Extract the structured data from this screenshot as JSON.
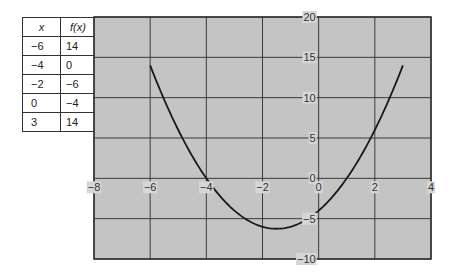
{
  "table": {
    "headers": [
      "x",
      "f(x)"
    ],
    "rows": [
      {
        "x": "−6",
        "fx": "14"
      },
      {
        "x": "−4",
        "fx": "0"
      },
      {
        "x": "−2",
        "fx": "−6"
      },
      {
        "x": "0",
        "fx": "−4"
      },
      {
        "x": "3",
        "fx": "14"
      }
    ]
  },
  "chart_data": {
    "type": "line",
    "title": "",
    "xlabel": "",
    "ylabel": "",
    "xlim": [
      -8,
      4
    ],
    "ylim": [
      -10,
      20
    ],
    "grid": true,
    "x_ticks": [
      -8,
      -6,
      -4,
      -2,
      0,
      2,
      4
    ],
    "y_ticks": [
      -10,
      -5,
      0,
      5,
      10,
      15,
      20
    ],
    "x_tick_labels": [
      "−8",
      "−6",
      "−4",
      "−2",
      "0",
      "2",
      "4"
    ],
    "y_tick_labels": [
      "−10",
      "−5",
      "0",
      "5",
      "10",
      "15",
      "20"
    ],
    "series": [
      {
        "name": "f(x) = x² + 3x − 4",
        "x": [
          -6,
          -5,
          -4,
          -3,
          -2,
          -1.5,
          -1,
          0,
          1,
          2,
          3
        ],
        "y": [
          14,
          6,
          0,
          -4,
          -6,
          -6.25,
          -6,
          -4,
          0,
          6,
          14
        ]
      }
    ],
    "colors": {
      "plot_background": "#c4c4c4",
      "grid": "#3a3a3a",
      "curve": "#1a1a1a"
    }
  }
}
